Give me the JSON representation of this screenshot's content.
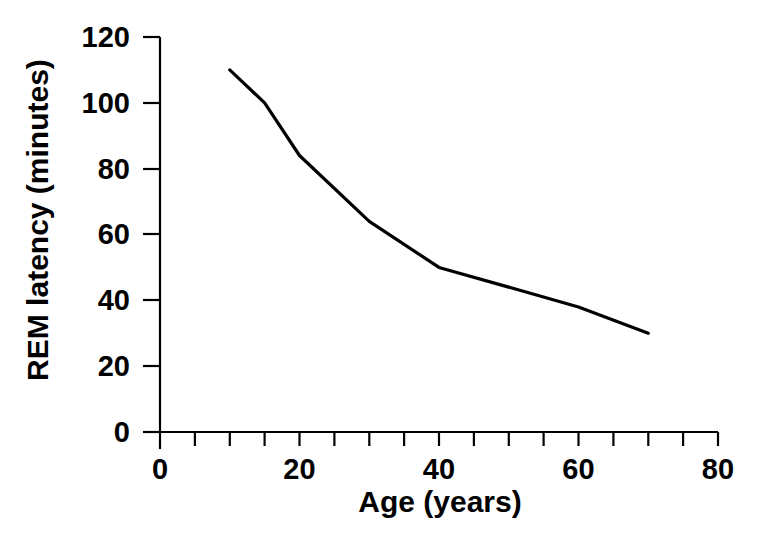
{
  "chart_data": {
    "type": "line",
    "title": "",
    "xlabel": "Age (years)",
    "ylabel": "REM latency (minutes)",
    "xlim": [
      0,
      80
    ],
    "ylim": [
      0,
      120
    ],
    "grid": false,
    "legend": null,
    "x_major_ticks": [
      0,
      20,
      40,
      60,
      80
    ],
    "x_tick_labels": [
      "0",
      "20",
      "40",
      "60",
      "80"
    ],
    "x_minor_tick_step": 5,
    "y_major_ticks": [
      0,
      20,
      40,
      60,
      80,
      100,
      120
    ],
    "y_tick_labels": [
      "0",
      "20",
      "40",
      "60",
      "80",
      "100",
      "120"
    ],
    "line_color": "#000000",
    "series": [
      {
        "name": "REM latency",
        "x": [
          10,
          15,
          20,
          30,
          40,
          60,
          70
        ],
        "values": [
          110,
          100,
          84,
          64,
          50,
          38,
          30
        ]
      }
    ]
  },
  "axes": {
    "y_title": "REM latency (minutes)",
    "x_title": "Age (years)",
    "y_ticks": [
      {
        "value": 120,
        "label": "120"
      },
      {
        "value": 100,
        "label": "100"
      },
      {
        "value": 80,
        "label": "80"
      },
      {
        "value": 60,
        "label": "60"
      },
      {
        "value": 40,
        "label": "40"
      },
      {
        "value": 20,
        "label": "20"
      },
      {
        "value": 0,
        "label": "0"
      }
    ],
    "x_ticks": [
      {
        "value": 0,
        "label": "0"
      },
      {
        "value": 20,
        "label": "20"
      },
      {
        "value": 40,
        "label": "40"
      },
      {
        "value": 60,
        "label": "60"
      },
      {
        "value": 80,
        "label": "80"
      }
    ]
  }
}
